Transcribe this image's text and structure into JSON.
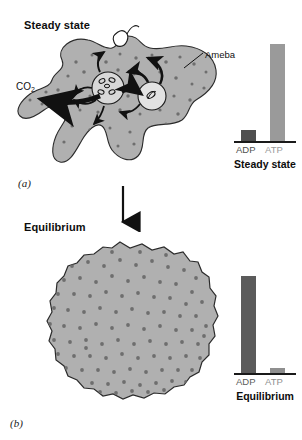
{
  "figure": {
    "panels": [
      {
        "tag": "(a)",
        "heading": "Steady state",
        "cell_label": "Ameba",
        "waste_label_html": "CO2",
        "waste_label_base": "CO",
        "waste_label_sub": "2"
      },
      {
        "tag": "(b)",
        "heading": "Equilibrium"
      }
    ]
  },
  "chart_data": [
    {
      "type": "bar",
      "title": "Steady state",
      "categories": [
        "ADP",
        "ATP"
      ],
      "values": [
        12,
        100
      ],
      "ylim": [
        0,
        100
      ],
      "xlabel": "",
      "ylabel": "",
      "grid": false,
      "legend": "none",
      "colors": {
        "ADP": "#4f4f4f",
        "ATP": "#9a9a9a"
      }
    },
    {
      "type": "bar",
      "title": "Equilibrium",
      "categories": [
        "ADP",
        "ATP"
      ],
      "values": [
        100,
        6
      ],
      "ylim": [
        0,
        100
      ],
      "xlabel": "",
      "ylabel": "",
      "grid": false,
      "legend": "none",
      "colors": {
        "ADP": "#5b5b5b",
        "ATP": "#8f8f8f"
      }
    }
  ],
  "palette": {
    "cytoplasm": "#b0b0b0",
    "granule": "#6e6e6e",
    "outline": "#2b2b2b",
    "arrow": "#111111",
    "organelle_fill": "#d8d8d8"
  }
}
